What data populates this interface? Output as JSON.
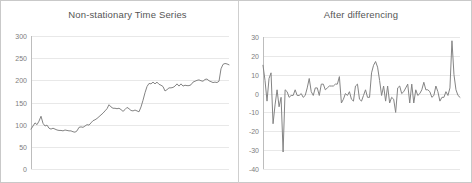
{
  "figure": {
    "background_color": "#ffffff",
    "border_color": "#c9c9c9",
    "line_color": "#848484",
    "grid_color": "#e8e8e8",
    "text_color": "#7d7d7d",
    "width": 472,
    "height": 183
  },
  "chart_data": [
    {
      "type": "line",
      "title": "Non-stationary Time Series",
      "xlabel": "",
      "ylabel": "",
      "ylim": [
        0,
        300
      ],
      "yticks": [
        0,
        50,
        100,
        150,
        200,
        250,
        300
      ],
      "ytick_labels": [
        "0",
        "50",
        "100",
        "150",
        "200",
        "250",
        "300"
      ],
      "xlim": [
        0,
        99
      ],
      "xticks": [],
      "xtick_labels": [],
      "grid": true,
      "legend": false,
      "series": [
        {
          "name": "Non-stationary series",
          "values": [
            90,
            97,
            104,
            100,
            108,
            119,
            103,
            97,
            99,
            92,
            90,
            92,
            90,
            88,
            87,
            87,
            86,
            88,
            87,
            86,
            86,
            84,
            83,
            86,
            94,
            95,
            94,
            97,
            100,
            99,
            104,
            109,
            111,
            114,
            118,
            122,
            126,
            131,
            136,
            145,
            140,
            137,
            137,
            136,
            137,
            134,
            130,
            134,
            139,
            136,
            132,
            131,
            133,
            131,
            129,
            140,
            155,
            172,
            186,
            193,
            192,
            196,
            192,
            196,
            191,
            189,
            186,
            176,
            179,
            183,
            183,
            184,
            187,
            192,
            187,
            192,
            187,
            189,
            188,
            188,
            190,
            196,
            198,
            200,
            201,
            199,
            198,
            202,
            203,
            199,
            197,
            195,
            196,
            195,
            198,
            226,
            236,
            238,
            237,
            235
          ]
        }
      ]
    },
    {
      "type": "line",
      "title": "After differencing",
      "xlabel": "",
      "ylabel": "",
      "ylim": [
        -40,
        30
      ],
      "yticks": [
        -40,
        -30,
        -20,
        -10,
        0,
        10,
        20,
        30
      ],
      "ytick_labels": [
        "-40",
        "-30",
        "-20",
        "-10",
        "0",
        "10",
        "20",
        "30"
      ],
      "xlim": [
        0,
        98
      ],
      "xticks": [],
      "xtick_labels": [],
      "grid": true,
      "legend": false,
      "series": [
        {
          "name": "First difference",
          "values": [
            15,
            7,
            -4,
            8,
            11,
            -16,
            -6,
            2,
            -7,
            -2,
            -31,
            2,
            1,
            -2,
            -1,
            -1,
            2,
            -1,
            -1,
            0,
            -2,
            -1,
            3,
            8,
            1,
            -1,
            3,
            3,
            -1,
            5,
            5,
            2,
            3,
            4,
            4,
            4,
            5,
            5,
            9,
            -5,
            -3,
            0,
            -1,
            1,
            -3,
            -4,
            4,
            5,
            -3,
            -4,
            -1,
            2,
            -2,
            -2,
            11,
            15,
            17,
            14,
            7,
            -1,
            4,
            -4,
            4,
            -5,
            -2,
            -3,
            -10,
            3,
            4,
            0,
            1,
            3,
            5,
            -5,
            5,
            -5,
            2,
            -1,
            0,
            2,
            6,
            2,
            2,
            1,
            -2,
            -1,
            4,
            1,
            -4,
            -2,
            -2,
            1,
            -1,
            3,
            28,
            10,
            2,
            -1,
            -2
          ]
        }
      ]
    }
  ]
}
